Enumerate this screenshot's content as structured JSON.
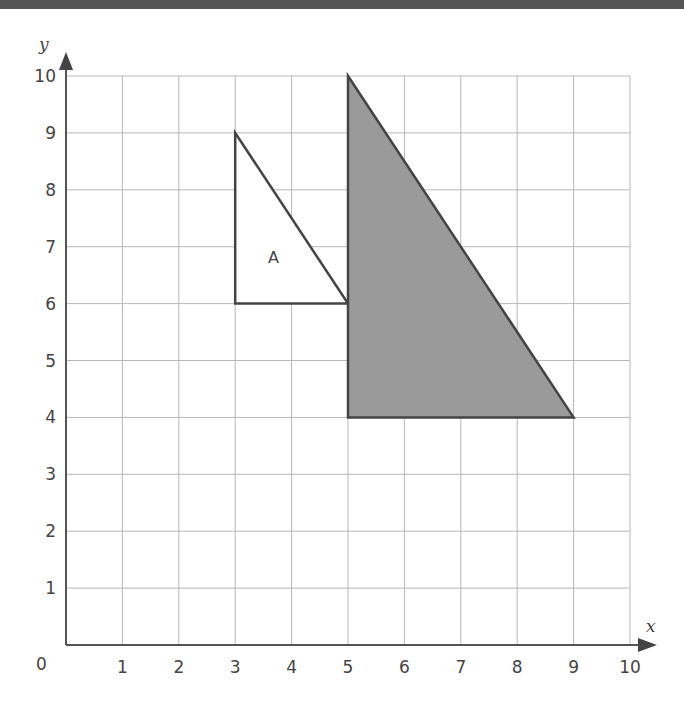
{
  "figure": {
    "x_axis_label": "x",
    "y_axis_label": "y",
    "origin_label": "0",
    "x_ticks": [
      "1",
      "2",
      "3",
      "4",
      "5",
      "6",
      "7",
      "8",
      "9",
      "10"
    ],
    "y_ticks": [
      "1",
      "2",
      "3",
      "4",
      "5",
      "6",
      "7",
      "8",
      "9",
      "10"
    ],
    "shape_a_label": "A"
  },
  "chart_data": {
    "type": "diagram",
    "title": "",
    "xlabel": "x",
    "ylabel": "y",
    "xlim": [
      0,
      10
    ],
    "ylim": [
      0,
      10
    ],
    "grid": true,
    "shapes": [
      {
        "name": "A",
        "kind": "triangle",
        "vertices": [
          [
            3,
            9
          ],
          [
            3,
            6
          ],
          [
            5,
            6
          ]
        ],
        "fill": "#ffffff",
        "stroke": "#444444"
      },
      {
        "name": "shaded",
        "kind": "triangle",
        "vertices": [
          [
            5,
            10
          ],
          [
            5,
            4
          ],
          [
            9,
            4
          ]
        ],
        "fill": "#9a9a9a",
        "stroke": "#444444"
      }
    ]
  },
  "colors": {
    "grid": "#b8b8b8",
    "axis": "#555555",
    "shaded_fill": "#9a9a9a",
    "outline": "#444444"
  }
}
